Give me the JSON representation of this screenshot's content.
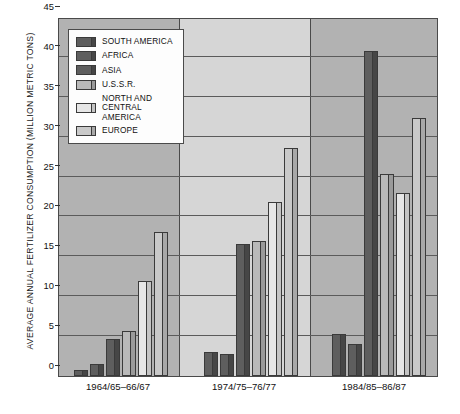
{
  "chart_data": {
    "type": "bar",
    "title": "",
    "subtitle": "",
    "xlabel": "",
    "ylabel": "AVERAGE ANNUAL FERTILIZER CONSUMPTION (MILLION METRIC TONS)",
    "categories": [
      "1964/65–66/67",
      "1974/75–76/77",
      "1984/85–86/87"
    ],
    "series": [
      {
        "name": "SOUTH AMERICA",
        "color": "#5e5e5e",
        "values": [
          0.8,
          3.0,
          5.3
        ]
      },
      {
        "name": "AFRICA",
        "color": "#5e5e5e",
        "values": [
          1.5,
          2.7,
          4.0
        ]
      },
      {
        "name": "ASIA",
        "color": "#5e5e5e",
        "values": [
          4.6,
          16.6,
          40.7
        ]
      },
      {
        "name": "U.S.S.R.",
        "color": "#b9b9b9",
        "values": [
          5.6,
          16.9,
          25.3
        ]
      },
      {
        "name": "NORTH AND\nCENTRAL AMERICA",
        "color": "#e6e6e6",
        "values": [
          11.9,
          21.8,
          22.9
        ]
      },
      {
        "name": "EUROPE",
        "color": "#c9c9c9",
        "values": [
          18.1,
          28.6,
          32.3
        ]
      }
    ],
    "ylim": [
      0,
      45
    ],
    "yticks": [
      0,
      5,
      10,
      15,
      20,
      25,
      30,
      35,
      40,
      45
    ],
    "ytick_labels": [
      "0",
      "5",
      "10",
      "15",
      "20",
      "25",
      "30",
      "35",
      "40",
      "45"
    ],
    "grid": true,
    "legend_position": "upper-left-inside",
    "panels": 3
  }
}
